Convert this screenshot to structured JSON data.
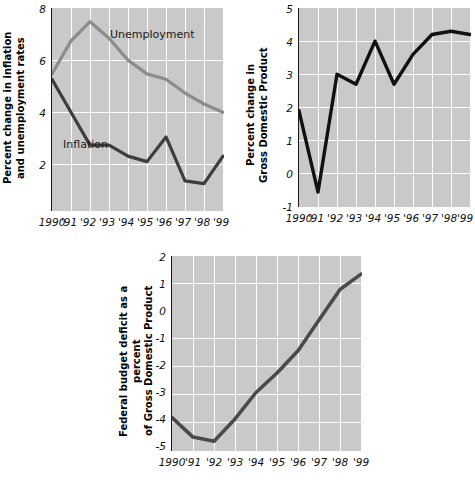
{
  "page": {
    "background_color": "#ffffff",
    "plot_background_color": "#c9c9c9",
    "gridline_color": "#ffffff"
  },
  "chart_data": [
    {
      "id": "inflation-unemployment",
      "type": "line",
      "title": "",
      "xlabel": "",
      "ylabel": "Percent change in inflation and unemployment rates",
      "ylabel_lines": [
        "Percent change in inflation",
        "and unemployment rates"
      ],
      "x": [
        1990,
        1991,
        1992,
        1993,
        1994,
        1995,
        1996,
        1997,
        1998,
        1999
      ],
      "categories": [
        "1990",
        "'91",
        "'92",
        "'93",
        "'94",
        "'95",
        "'96",
        "'97",
        "'98",
        "'99"
      ],
      "xticklabels": [
        "1990",
        "'91",
        "'92",
        "'93",
        "'94",
        "'95",
        "'96",
        "'97",
        "'98",
        "'99"
      ],
      "yticklabels": [
        "2",
        "4",
        "6",
        "8"
      ],
      "yticks": [
        2,
        4,
        6,
        8
      ],
      "ylim": [
        0.6,
        8
      ],
      "xlim": [
        1990,
        1999
      ],
      "grid": true,
      "legend_position": "inline-annotation",
      "series": [
        {
          "name": "Unemployment",
          "color": "#8c8c8c",
          "values": [
            5.6,
            6.8,
            7.5,
            6.9,
            6.1,
            5.6,
            5.4,
            4.9,
            4.5,
            4.2
          ],
          "annotation": "Unemployment"
        },
        {
          "name": "Inflation",
          "color": "#3d3d3d",
          "values": [
            5.4,
            4.2,
            3.0,
            3.0,
            2.6,
            2.4,
            3.3,
            1.7,
            1.6,
            2.6
          ],
          "annotation": "Inflation"
        }
      ]
    },
    {
      "id": "gdp",
      "type": "line",
      "title": "",
      "xlabel": "",
      "ylabel": "Percent change in Gross Domestic Product",
      "ylabel_lines": [
        "Percent change in",
        "Gross Domestic Product"
      ],
      "x": [
        1990,
        1991,
        1992,
        1993,
        1994,
        1995,
        1996,
        1997,
        1998,
        1999
      ],
      "categories": [
        "1990",
        "'91",
        "'92",
        "'93",
        "'94",
        "'95",
        "'96",
        "'97",
        "'98",
        "'99"
      ],
      "xticklabels": [
        "1990",
        "'91",
        "'92",
        "'93",
        "'94",
        "'95",
        "'96",
        "'97",
        "'98",
        "'99"
      ],
      "yticklabels": [
        "-1",
        "0",
        "1",
        "2",
        "3",
        "4",
        "5"
      ],
      "yticks": [
        -1,
        0,
        1,
        2,
        3,
        4,
        5
      ],
      "ylim": [
        -1,
        5
      ],
      "xlim": [
        1990,
        1999
      ],
      "grid": true,
      "zero_line": 0,
      "series": [
        {
          "name": "Gross Domestic Product",
          "color": "#111111",
          "values": [
            1.9,
            -0.55,
            3.0,
            2.7,
            4.0,
            2.7,
            3.6,
            4.2,
            4.3,
            4.2
          ]
        }
      ]
    },
    {
      "id": "deficit",
      "type": "line",
      "title": "",
      "xlabel": "",
      "ylabel": "Federal budget deficit as a percent of Gross Domestic Product",
      "ylabel_lines": [
        "Federal budget deficit as a percent",
        "of Gross Domestic Product"
      ],
      "x": [
        1990,
        1991,
        1992,
        1993,
        1994,
        1995,
        1996,
        1997,
        1998,
        1999
      ],
      "categories": [
        "1990",
        "'91",
        "'92",
        "'93",
        "'94",
        "'95",
        "'96",
        "'97",
        "'98",
        "'99"
      ],
      "xticklabels": [
        "1990",
        "'91",
        "'92",
        "'93",
        "'94",
        "'95",
        "'96",
        "'97",
        "'98",
        "'99"
      ],
      "yticklabels": [
        "-5",
        "-4",
        "-3",
        "-2",
        "-1",
        "0",
        "1",
        "2"
      ],
      "yticks": [
        -5,
        -4,
        -3,
        -2,
        -1,
        0,
        1,
        2
      ],
      "ylim": [
        -5,
        2
      ],
      "xlim": [
        1990,
        1999
      ],
      "grid": true,
      "zero_line": 0,
      "series": [
        {
          "name": "Federal budget deficit as a percent of GDP",
          "color": "#4a4a4a",
          "values": [
            -3.8,
            -4.5,
            -4.65,
            -3.85,
            -2.9,
            -2.2,
            -1.4,
            -0.3,
            0.8,
            1.35
          ]
        }
      ]
    }
  ]
}
